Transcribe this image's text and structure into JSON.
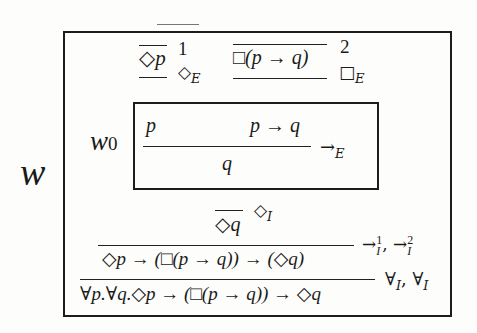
{
  "diagram": {
    "outer_world_label": "w",
    "inner_world_label": "w",
    "inner_world_subscript": "0",
    "top_faint_rule": true,
    "premises": [
      {
        "formula": "◇p",
        "hyp_index": "1",
        "rule_name": "◇",
        "rule_subscript": "E"
      },
      {
        "formula": "□(p → q)",
        "hyp_index": "2",
        "rule_name": "□",
        "rule_subscript": "E"
      }
    ],
    "inner_box": {
      "premise_left": "p",
      "premise_right": "p → q",
      "conclusion": "q",
      "rule_name": "→",
      "rule_subscript": "E"
    },
    "diamond_intro": {
      "formula": "◇q",
      "rule_name": "◇",
      "rule_subscript": "I"
    },
    "impl_intro": {
      "formula": "◇p → (□(p → q)) → (◇q)",
      "rule_label_1": "→",
      "rule_sup_1": "1",
      "rule_sub_1": "I",
      "separator": ",",
      "rule_label_2": "→",
      "rule_sup_2": "2",
      "rule_sub_2": "I"
    },
    "forall_intro": {
      "formula": "∀p.∀q.◇p → (□(p → q)) → ◇q",
      "rule_name_1": "∀",
      "rule_sub_1": "I",
      "separator": ",",
      "rule_name_2": "∀",
      "rule_sub_2": "I"
    }
  }
}
